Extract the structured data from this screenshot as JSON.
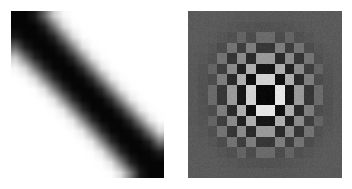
{
  "figure": {
    "background_color": "#ffffff",
    "width": 352,
    "height": 189,
    "layout": "two-panels-side-by-side",
    "panel_count": 2
  },
  "panels": [
    {
      "name": "spatial-domain-matrix",
      "position": "left",
      "x": 11,
      "y": 11,
      "width": 153,
      "height": 167,
      "grid_rows": 16,
      "grid_cols": 16,
      "colormap": "gray",
      "interpolation": "bilinear",
      "background_color": "#ffffff",
      "min_color": "#000000",
      "max_color": "#ffffff",
      "description": "dark diagonal band on white background"
    },
    {
      "name": "frequency-domain-matrix",
      "position": "right",
      "x": 188,
      "y": 11,
      "width": 154,
      "height": 167,
      "grid_rows": 16,
      "grid_cols": 16,
      "colormap": "gray",
      "interpolation": "nearest",
      "background_color": "#5a5a5a",
      "min_color": "#000000",
      "max_color": "#ffffff",
      "description": "checkerboard pattern with radial brightness falloff toward uniform mid-gray edges"
    }
  ],
  "chart_data": [
    {
      "type": "heatmap",
      "title": "",
      "xlabel": "",
      "ylabel": "",
      "panel": "spatial-domain-matrix",
      "colormap": "gray",
      "vmin": 0,
      "vmax": 1,
      "grid": false,
      "legend": "none",
      "rows": 16,
      "cols": 16,
      "values": [
        [
          0.02,
          0.02,
          0.1,
          0.4,
          0.8,
          0.97,
          1.0,
          1.0,
          1.0,
          1.0,
          1.0,
          1.0,
          1.0,
          1.0,
          1.0,
          1.0
        ],
        [
          0.02,
          0.02,
          0.02,
          0.12,
          0.45,
          0.84,
          0.98,
          1.0,
          1.0,
          1.0,
          1.0,
          1.0,
          1.0,
          1.0,
          1.0,
          1.0
        ],
        [
          0.1,
          0.02,
          0.02,
          0.03,
          0.14,
          0.48,
          0.86,
          0.99,
          1.0,
          1.0,
          1.0,
          1.0,
          1.0,
          1.0,
          1.0,
          1.0
        ],
        [
          0.4,
          0.12,
          0.03,
          0.02,
          0.03,
          0.16,
          0.5,
          0.88,
          0.99,
          1.0,
          1.0,
          1.0,
          1.0,
          1.0,
          1.0,
          1.0
        ],
        [
          0.8,
          0.45,
          0.14,
          0.03,
          0.02,
          0.03,
          0.17,
          0.52,
          0.89,
          0.99,
          1.0,
          1.0,
          1.0,
          1.0,
          1.0,
          1.0
        ],
        [
          0.97,
          0.84,
          0.48,
          0.16,
          0.03,
          0.02,
          0.03,
          0.18,
          0.53,
          0.9,
          0.99,
          1.0,
          1.0,
          1.0,
          1.0,
          1.0
        ],
        [
          1.0,
          0.98,
          0.86,
          0.5,
          0.17,
          0.03,
          0.02,
          0.03,
          0.18,
          0.54,
          0.9,
          0.99,
          1.0,
          1.0,
          1.0,
          1.0
        ],
        [
          1.0,
          1.0,
          0.99,
          0.88,
          0.52,
          0.18,
          0.03,
          0.02,
          0.03,
          0.18,
          0.54,
          0.9,
          0.99,
          1.0,
          1.0,
          1.0
        ],
        [
          1.0,
          1.0,
          1.0,
          0.99,
          0.89,
          0.53,
          0.18,
          0.03,
          0.02,
          0.03,
          0.18,
          0.54,
          0.9,
          0.99,
          1.0,
          1.0
        ],
        [
          1.0,
          1.0,
          1.0,
          1.0,
          0.99,
          0.9,
          0.54,
          0.18,
          0.03,
          0.02,
          0.03,
          0.18,
          0.53,
          0.89,
          0.99,
          1.0
        ],
        [
          1.0,
          1.0,
          1.0,
          1.0,
          1.0,
          0.99,
          0.9,
          0.54,
          0.18,
          0.03,
          0.02,
          0.03,
          0.17,
          0.52,
          0.88,
          0.99
        ],
        [
          1.0,
          1.0,
          1.0,
          1.0,
          1.0,
          1.0,
          0.99,
          0.9,
          0.54,
          0.18,
          0.03,
          0.02,
          0.03,
          0.16,
          0.5,
          0.86
        ],
        [
          1.0,
          1.0,
          1.0,
          1.0,
          1.0,
          1.0,
          1.0,
          0.99,
          0.9,
          0.53,
          0.17,
          0.03,
          0.02,
          0.03,
          0.14,
          0.48
        ],
        [
          1.0,
          1.0,
          1.0,
          1.0,
          1.0,
          1.0,
          1.0,
          1.0,
          0.99,
          0.89,
          0.52,
          0.16,
          0.03,
          0.02,
          0.03,
          0.12
        ],
        [
          1.0,
          1.0,
          1.0,
          1.0,
          1.0,
          1.0,
          1.0,
          1.0,
          1.0,
          0.99,
          0.88,
          0.5,
          0.14,
          0.03,
          0.02,
          0.02
        ],
        [
          1.0,
          1.0,
          1.0,
          1.0,
          1.0,
          1.0,
          1.0,
          1.0,
          1.0,
          1.0,
          0.99,
          0.86,
          0.48,
          0.1,
          0.02,
          0.02
        ]
      ]
    },
    {
      "type": "heatmap",
      "title": "",
      "xlabel": "",
      "ylabel": "",
      "panel": "frequency-domain-matrix",
      "colormap": "gray",
      "vmin": 0,
      "vmax": 1,
      "grid": false,
      "legend": "none",
      "rows": 16,
      "cols": 16,
      "base_level": 0.355,
      "pattern": "checkerboard",
      "envelope": "radial-gaussian",
      "envelope_sigma_cells": 3.4,
      "envelope_amplitude": 0.62,
      "values": [
        [
          0.355,
          0.355,
          0.355,
          0.355,
          0.35,
          0.345,
          0.345,
          0.345,
          0.345,
          0.345,
          0.345,
          0.35,
          0.355,
          0.355,
          0.355,
          0.355
        ],
        [
          0.355,
          0.355,
          0.355,
          0.35,
          0.34,
          0.33,
          0.325,
          0.32,
          0.32,
          0.325,
          0.33,
          0.34,
          0.35,
          0.355,
          0.355,
          0.355
        ],
        [
          0.355,
          0.355,
          0.35,
          0.335,
          0.315,
          0.39,
          0.3,
          0.415,
          0.415,
          0.3,
          0.39,
          0.315,
          0.335,
          0.35,
          0.355,
          0.355
        ],
        [
          0.355,
          0.35,
          0.335,
          0.3,
          0.45,
          0.245,
          0.49,
          0.215,
          0.215,
          0.49,
          0.245,
          0.45,
          0.3,
          0.335,
          0.35,
          0.355
        ],
        [
          0.35,
          0.34,
          0.315,
          0.45,
          0.21,
          0.54,
          0.165,
          0.6,
          0.6,
          0.165,
          0.54,
          0.21,
          0.45,
          0.315,
          0.34,
          0.35
        ],
        [
          0.345,
          0.33,
          0.39,
          0.245,
          0.54,
          0.13,
          0.68,
          0.085,
          0.085,
          0.68,
          0.13,
          0.54,
          0.245,
          0.39,
          0.33,
          0.345
        ],
        [
          0.345,
          0.325,
          0.3,
          0.49,
          0.165,
          0.68,
          0.06,
          0.82,
          0.82,
          0.06,
          0.68,
          0.165,
          0.49,
          0.3,
          0.325,
          0.345
        ],
        [
          0.345,
          0.32,
          0.415,
          0.215,
          0.6,
          0.085,
          0.82,
          0.03,
          0.03,
          0.9,
          0.085,
          0.6,
          0.215,
          0.415,
          0.32,
          0.345
        ],
        [
          0.345,
          0.32,
          0.415,
          0.215,
          0.6,
          0.085,
          0.82,
          0.03,
          0.03,
          0.9,
          0.085,
          0.6,
          0.215,
          0.415,
          0.32,
          0.345
        ],
        [
          0.345,
          0.325,
          0.3,
          0.49,
          0.165,
          0.68,
          0.06,
          0.9,
          0.9,
          0.06,
          0.68,
          0.165,
          0.49,
          0.3,
          0.325,
          0.345
        ],
        [
          0.345,
          0.33,
          0.39,
          0.245,
          0.54,
          0.13,
          0.68,
          0.085,
          0.085,
          0.68,
          0.13,
          0.54,
          0.245,
          0.39,
          0.33,
          0.345
        ],
        [
          0.35,
          0.34,
          0.315,
          0.45,
          0.21,
          0.54,
          0.165,
          0.6,
          0.6,
          0.165,
          0.54,
          0.21,
          0.45,
          0.315,
          0.34,
          0.35
        ],
        [
          0.355,
          0.35,
          0.335,
          0.3,
          0.45,
          0.245,
          0.49,
          0.215,
          0.215,
          0.49,
          0.245,
          0.45,
          0.3,
          0.335,
          0.35,
          0.355
        ],
        [
          0.355,
          0.355,
          0.35,
          0.335,
          0.315,
          0.39,
          0.3,
          0.415,
          0.415,
          0.3,
          0.39,
          0.315,
          0.335,
          0.35,
          0.355,
          0.355
        ],
        [
          0.355,
          0.355,
          0.355,
          0.35,
          0.34,
          0.33,
          0.325,
          0.32,
          0.32,
          0.325,
          0.33,
          0.34,
          0.35,
          0.355,
          0.355,
          0.355
        ],
        [
          0.355,
          0.355,
          0.355,
          0.355,
          0.35,
          0.345,
          0.345,
          0.345,
          0.345,
          0.345,
          0.345,
          0.35,
          0.355,
          0.355,
          0.355,
          0.355
        ]
      ]
    }
  ]
}
